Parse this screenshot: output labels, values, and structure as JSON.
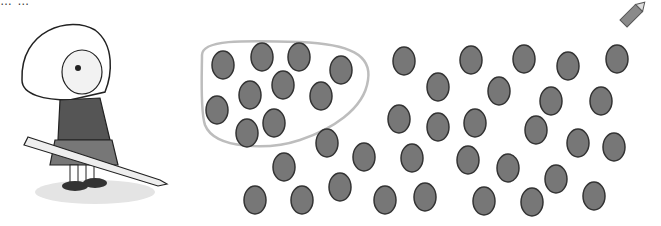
{
  "header": {
    "partial_text": "… …"
  },
  "illustration": {
    "subject": "girl-holding-pencil",
    "style": "grayscale cartoon"
  },
  "corner_icon": "pencil-icon",
  "colors": {
    "dot_fill": "#777777",
    "dot_stroke": "#333333",
    "loop_stroke": "#bdbdbd"
  },
  "dots": {
    "dot_size": [
      22,
      28
    ],
    "circled_count": 10,
    "uncircled_count": 31,
    "circled": [
      [
        223,
        65
      ],
      [
        262,
        57
      ],
      [
        299,
        57
      ],
      [
        341,
        70
      ],
      [
        250,
        95
      ],
      [
        283,
        85
      ],
      [
        321,
        96
      ],
      [
        217,
        110
      ],
      [
        274,
        123
      ],
      [
        247,
        133
      ]
    ],
    "uncircled": [
      [
        404,
        61
      ],
      [
        471,
        60
      ],
      [
        524,
        59
      ],
      [
        568,
        66
      ],
      [
        617,
        59
      ],
      [
        438,
        87
      ],
      [
        499,
        91
      ],
      [
        551,
        101
      ],
      [
        601,
        101
      ],
      [
        399,
        119
      ],
      [
        438,
        127
      ],
      [
        475,
        123
      ],
      [
        536,
        130
      ],
      [
        578,
        143
      ],
      [
        614,
        147
      ],
      [
        327,
        143
      ],
      [
        364,
        157
      ],
      [
        412,
        158
      ],
      [
        468,
        160
      ],
      [
        508,
        168
      ],
      [
        556,
        179
      ],
      [
        284,
        167
      ],
      [
        255,
        200
      ],
      [
        302,
        200
      ],
      [
        340,
        187
      ],
      [
        385,
        200
      ],
      [
        425,
        197
      ],
      [
        484,
        201
      ],
      [
        532,
        202
      ],
      [
        594,
        196
      ],
      [
        640,
        -50
      ]
    ]
  }
}
